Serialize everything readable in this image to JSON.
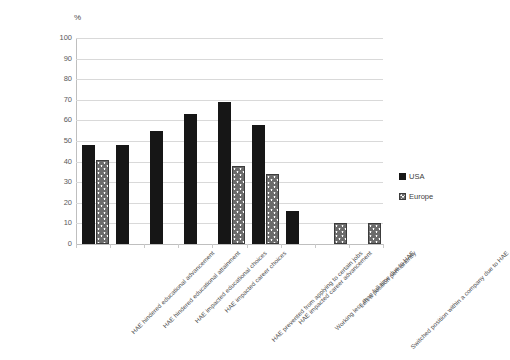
{
  "chart_data": {
    "type": "bar",
    "title": "",
    "subtitle": "",
    "xlabel": "",
    "ylabel": "%",
    "ylim": [
      0,
      100
    ],
    "ytick_step": 10,
    "ytick_labels": [
      "100",
      "90",
      "80",
      "70",
      "60",
      "50",
      "40",
      "30",
      "20",
      "10",
      "0"
    ],
    "grid": true,
    "legend_position": "right",
    "categories": [
      "HAE hindered educational advancement",
      "HAE hindered educational attainment",
      "HAE impacted educational choices",
      "HAE impacted career choices",
      "HAE prevented from applying to certain jobs",
      "HAE impacted career advancement",
      "Working less than full time due to HAE",
      "Left a position permanently",
      "Switched position within a company due to HAE"
    ],
    "series": [
      {
        "name": "USA",
        "color": "#161616",
        "values": [
          48,
          48,
          55,
          63,
          69,
          58,
          16,
          null,
          null
        ]
      },
      {
        "name": "Europe",
        "color": "#6b6b6b",
        "values": [
          41,
          null,
          null,
          null,
          38,
          34,
          null,
          10,
          10
        ]
      }
    ]
  },
  "legend": {
    "items": [
      {
        "label": "USA"
      },
      {
        "label": "Europe"
      }
    ]
  },
  "axis": {
    "unit_label": "%"
  }
}
